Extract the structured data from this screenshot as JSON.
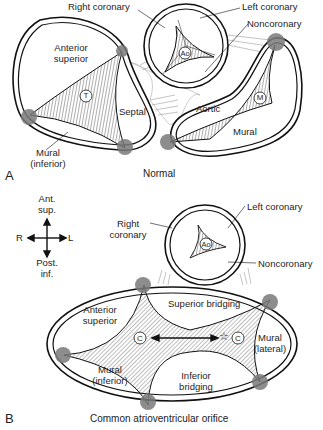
{
  "figure": {
    "panels": [
      {
        "id": "A",
        "caption": "Normal",
        "labels": {
          "right_coronary": "Right coronary",
          "left_coronary": "Left coronary",
          "noncoronary": "Noncoronary",
          "anterior_superior_1": "Anterior",
          "anterior_superior_2": "superior",
          "septal": "Septal",
          "mural_inferior_1": "Mural",
          "mural_inferior_2": "(inferior)",
          "aortic": "Aortic",
          "mural": "Mural",
          "tricuspid_marker": "T",
          "mitral_marker": "M",
          "aorta_marker": "Ao"
        }
      },
      {
        "id": "B",
        "caption": "Common atrioventricular orifice",
        "labels": {
          "right_coronary_1": "Right",
          "right_coronary_2": "coronary",
          "left_coronary": "Left coronary",
          "noncoronary": "Noncoronary",
          "aorta_marker": "Ao",
          "anterior_superior_1": "Anterior",
          "anterior_superior_2": "superior",
          "superior_bridging": "Superior bridging",
          "inferior_bridging_1": "Inferior",
          "inferior_bridging_2": "bridging",
          "mural_inferior_1": "Mural",
          "mural_inferior_2": "(inferior)",
          "mural_lateral_1": "Mural",
          "mural_lateral_2": "(lateral)",
          "commissure_marker_left": "C",
          "commissure_marker_right": "C",
          "star": "☆"
        },
        "orientation": {
          "top_1": "Ant.",
          "top_2": "sup.",
          "bottom_1": "Post.",
          "bottom_2": "inf.",
          "left": "R",
          "right": "L"
        }
      }
    ],
    "colors": {
      "ink": "#1a1a1a",
      "commissure_dot": "#7a7a7a",
      "hatch": "#333333"
    }
  }
}
